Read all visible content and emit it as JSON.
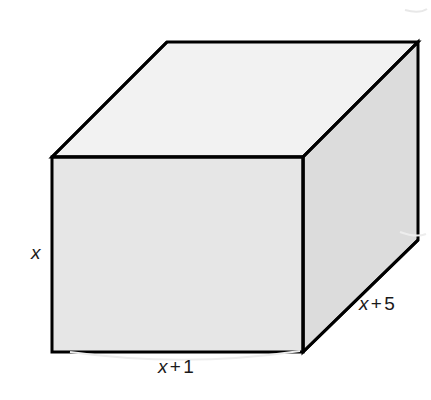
{
  "figure": {
    "kind": "rectangular-prism-diagram",
    "background_color": "#ffffff",
    "edge_color": "#000000",
    "faces": {
      "front": {
        "name": "front-face",
        "fill": "#e6e6e6"
      },
      "top": {
        "name": "top-face",
        "fill": "#f2f2f2"
      },
      "right": {
        "name": "right-face",
        "fill": "#dcdcdc"
      }
    },
    "geometry": {
      "front_top_left": [
        52,
        157
      ],
      "front_top_right": [
        303,
        157
      ],
      "front_bottom_right": [
        303,
        352
      ],
      "front_bottom_left": [
        52,
        352
      ],
      "back_top_left": [
        167,
        42
      ],
      "back_top_right": [
        418,
        42
      ],
      "back_bottom_right": [
        418,
        240
      ]
    },
    "labels": {
      "height": {
        "name": "height-label",
        "text": "x",
        "variable": "x",
        "operator": "",
        "constant": ""
      },
      "width": {
        "name": "width-label",
        "text": "x + 1",
        "variable": "x",
        "operator": "+",
        "constant": "1"
      },
      "depth": {
        "name": "depth-label",
        "text": "x + 5",
        "variable": "x",
        "operator": "+",
        "constant": "5"
      }
    }
  }
}
